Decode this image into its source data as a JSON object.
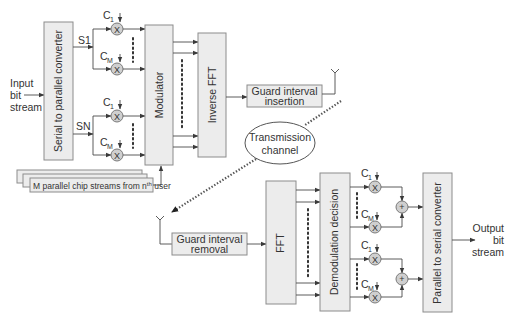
{
  "diagram": {
    "input": {
      "line1": "Input",
      "line2": "bit",
      "line3": "stream"
    },
    "output": {
      "line1": "Output",
      "line2": "bit",
      "line3": "stream"
    },
    "blocks": {
      "sp_converter": "Serial to parallel converter",
      "modulator": "Modulator",
      "ifft": "Inverse FFT",
      "gi_insert_1": "Guard interval",
      "gi_insert_2": "insertion",
      "channel_1": "Transmission",
      "channel_2": "channel",
      "gi_remove_1": "Guard interval",
      "gi_remove_2": "removal",
      "fft": "FFT",
      "demod": "Demodulation decision",
      "ps_converter": "Parallel to serial converter",
      "chip_streams": "M parallel chip streams from n",
      "chip_streams_sup": "th",
      "chip_streams_tail": " user"
    },
    "signals": {
      "s1": "S1",
      "sn": "SN",
      "c": "C",
      "sub_1": "1",
      "sub_m": "M"
    },
    "operators": {
      "multiply": "X",
      "add": "+"
    }
  }
}
